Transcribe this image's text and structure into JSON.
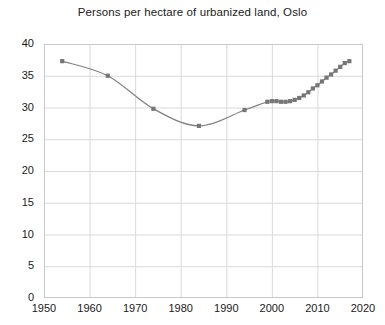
{
  "chart_data": {
    "type": "line",
    "title": "Persons per hectare of urbanized land, Oslo",
    "xlabel": "",
    "ylabel": "",
    "xlim": [
      1950,
      2020
    ],
    "ylim": [
      0,
      40
    ],
    "xticks": [
      1950,
      1960,
      1970,
      1980,
      1990,
      2000,
      2010,
      2020
    ],
    "xtick_labels": [
      "1950",
      "1960",
      "1970",
      "1980",
      "1990",
      "2000",
      "2010",
      "2020"
    ],
    "yticks": [
      0,
      5,
      10,
      15,
      20,
      25,
      30,
      35,
      40
    ],
    "ytick_labels": [
      "0",
      "5",
      "10",
      "15",
      "20",
      "25",
      "30",
      "35",
      "40"
    ],
    "grid": true,
    "legend": false,
    "legend_position": "none",
    "marker": "square",
    "line_color": "#808080",
    "marker_color": "#767676",
    "grid_color": "#d9d9d9",
    "axis_color": "#c8c8c8",
    "background_color": "#ffffff",
    "x": [
      1954,
      1964,
      1974,
      1984,
      1994,
      1999,
      2000,
      2001,
      2002,
      2003,
      2004,
      2005,
      2006,
      2007,
      2008,
      2009,
      2010,
      2011,
      2012,
      2013,
      2014,
      2015,
      2016,
      2017
    ],
    "values": [
      37.3,
      35.0,
      29.8,
      27.1,
      29.6,
      30.9,
      31.0,
      31.0,
      30.9,
      30.9,
      31.0,
      31.2,
      31.5,
      31.9,
      32.4,
      33.0,
      33.5,
      34.1,
      34.7,
      35.2,
      35.8,
      36.4,
      37.0,
      37.3
    ],
    "series": [
      {
        "name": "Persons per hectare",
        "x": [
          1954,
          1964,
          1974,
          1984,
          1994,
          1999,
          2000,
          2001,
          2002,
          2003,
          2004,
          2005,
          2006,
          2007,
          2008,
          2009,
          2010,
          2011,
          2012,
          2013,
          2014,
          2015,
          2016,
          2017
        ],
        "values": [
          37.3,
          35.0,
          29.8,
          27.1,
          29.6,
          30.9,
          31.0,
          31.0,
          30.9,
          30.9,
          31.0,
          31.2,
          31.5,
          31.9,
          32.4,
          33.0,
          33.5,
          34.1,
          34.7,
          35.2,
          35.8,
          36.4,
          37.0,
          37.3
        ]
      }
    ]
  }
}
